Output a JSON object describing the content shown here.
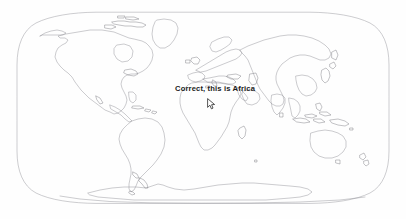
{
  "app": {
    "kind": "world-map-screenshot",
    "background_color": "#fefefe"
  },
  "map": {
    "name": "world-map",
    "projection": "Robinson",
    "coastline_color": "#8d8d93",
    "frame_color": "#9a9aa0",
    "fill_color": "#ffffff",
    "continents_visible": [
      "North America",
      "South America",
      "Europe",
      "Africa",
      "Asia",
      "Australia",
      "Antarctica"
    ]
  },
  "annotation": {
    "label": "Correct, this is Africa",
    "color": "#1a1a1a",
    "target_region": "Africa"
  },
  "cursor": {
    "icon": "mouse-pointer-icon",
    "x": 207,
    "y": 96
  }
}
